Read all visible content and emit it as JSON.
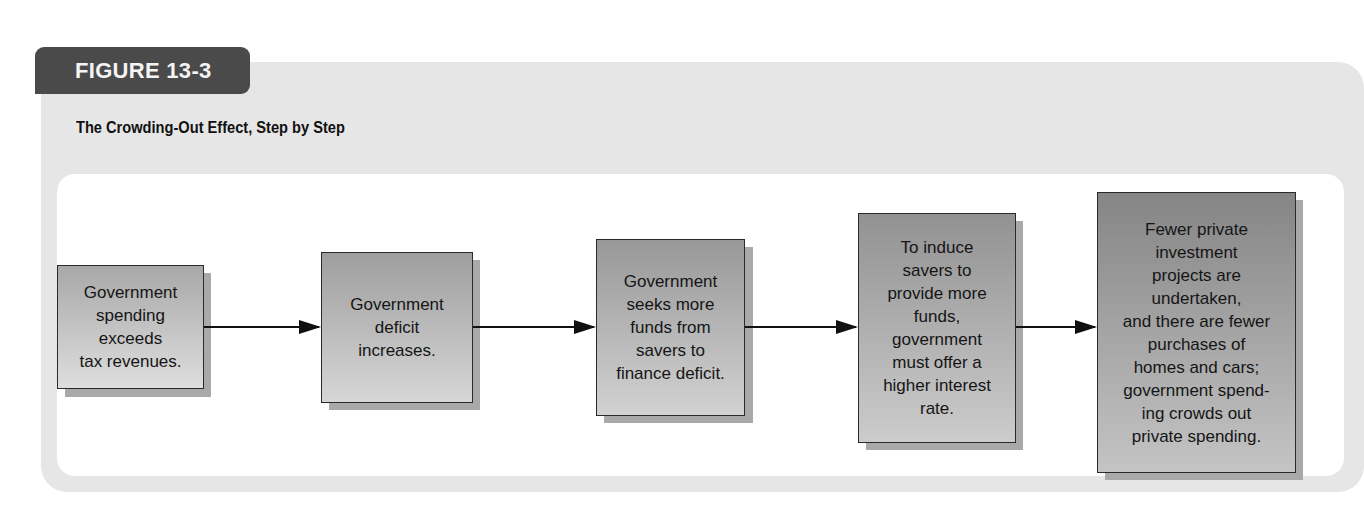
{
  "figure": {
    "label": "FIGURE 13-3",
    "title": "The Crowding-Out Effect, Step by Step"
  },
  "colors": {
    "tag_background": "#4a4a4a",
    "outer_panel": "#e6e6e6",
    "inner_panel": "#ffffff",
    "box_border": "#2a2a2a",
    "box_shadow": "#a9a9a9",
    "arrow": "#111111"
  },
  "steps": [
    {
      "text": "Government\nspending\nexceeds\ntax revenues.",
      "gradient_top": "#a8a8a8",
      "gradient_bottom": "#dedede"
    },
    {
      "text": "Government\ndeficit\nincreases.",
      "gradient_top": "#9e9e9e",
      "gradient_bottom": "#d6d6d6"
    },
    {
      "text": "Government\nseeks more\nfunds from\nsavers to\nfinance deficit.",
      "gradient_top": "#989898",
      "gradient_bottom": "#d2d2d2"
    },
    {
      "text": "To induce\nsavers to\nprovide more\nfunds,\ngovernment\nmust offer a\nhigher interest\nrate.",
      "gradient_top": "#929292",
      "gradient_bottom": "#cccccc"
    },
    {
      "text": "Fewer private\ninvestment\nprojects are\nundertaken,\nand there are fewer\npurchases of\nhomes and cars;\ngovernment spend-\ning crowds out\nprivate spending.",
      "gradient_top": "#858585",
      "gradient_bottom": "#c4c4c4"
    }
  ],
  "connectors": [
    {
      "from": 1,
      "to": 2,
      "icon": "arrow-right-icon"
    },
    {
      "from": 2,
      "to": 3,
      "icon": "arrow-right-icon"
    },
    {
      "from": 3,
      "to": 4,
      "icon": "arrow-right-icon"
    },
    {
      "from": 4,
      "to": 5,
      "icon": "arrow-right-icon"
    }
  ]
}
